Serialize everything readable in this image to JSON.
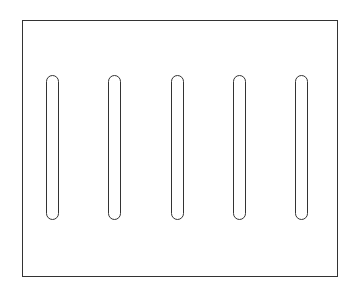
{
  "diagram": {
    "stroke_color": "#333333",
    "fill_color": "#ffffff",
    "frame": {
      "x": 22,
      "y": 20,
      "width": 316,
      "height": 257
    },
    "slots": [
      {
        "x": 46,
        "y": 75,
        "width": 13,
        "height": 145
      },
      {
        "x": 108,
        "y": 75,
        "width": 13,
        "height": 145
      },
      {
        "x": 171,
        "y": 75,
        "width": 13,
        "height": 145
      },
      {
        "x": 233,
        "y": 75,
        "width": 13,
        "height": 145
      },
      {
        "x": 295,
        "y": 75,
        "width": 13,
        "height": 145
      }
    ]
  }
}
